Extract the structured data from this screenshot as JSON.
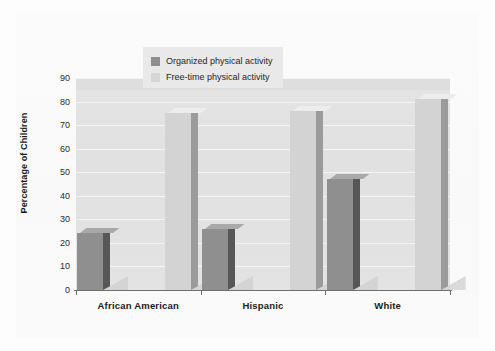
{
  "chart_data": {
    "type": "bar",
    "title": "",
    "subtitle": "",
    "xlabel": "",
    "ylabel": "Percentage of Children",
    "ylim": [
      0,
      90
    ],
    "ytick_step": 10,
    "yticks": [
      "90",
      "80",
      "70",
      "60",
      "50",
      "40",
      "30",
      "20",
      "10",
      "0"
    ],
    "grid": true,
    "legend_position": "top-center",
    "categories": [
      "African American",
      "Hispanic",
      "White"
    ],
    "series": [
      {
        "name": "Organized physical activity",
        "color": "#8f8f8f",
        "values": [
          24,
          26,
          47
        ]
      },
      {
        "name": "Free-time physical activity",
        "color": "#d3d3d3",
        "values": [
          75,
          76,
          81
        ]
      }
    ]
  },
  "legend": {
    "items": [
      {
        "label": "Organized physical activity",
        "swatch_color": "#8f8f8f"
      },
      {
        "label": "Free-time physical activity",
        "swatch_color": "#d6d6d6"
      }
    ]
  },
  "axes": {
    "y_title": "Percentage of Children"
  },
  "colors": {
    "plot_background": "#e2e2e2",
    "gridline": "#f4f4f4",
    "axis": "#6e6e6e",
    "page_background": "#fbfbfb",
    "text": "#1b1b1b",
    "legend_background": "#e9e9e9"
  }
}
